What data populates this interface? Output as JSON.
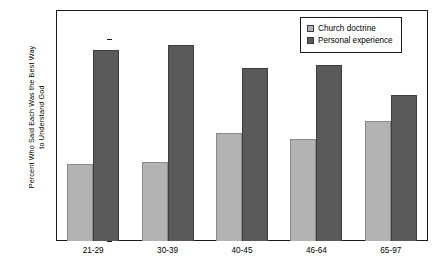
{
  "chart_data": {
    "type": "bar",
    "title": "",
    "subtitle": "",
    "xlabel": "",
    "ylabel": "Percent Who Said Each Was the Best Way\nto Understand God",
    "categories": [
      "21-29",
      "30-39",
      "40-45",
      "46-64",
      "65-97"
    ],
    "series": [
      {
        "name": "Church doctrine",
        "values": [
          26.5,
          27.5,
          37.5,
          35.5,
          41.5
        ],
        "color": "#b3b3b3"
      },
      {
        "name": "Personal experience",
        "values": [
          66.0,
          68.0,
          59.8,
          61.0,
          50.7
        ],
        "color": "#5a5a5a"
      }
    ],
    "ylim": [
      0,
      80
    ],
    "ytick_step": 10,
    "yticks": [
      0,
      10,
      20,
      30,
      40,
      50,
      60,
      70,
      80
    ],
    "grid": false,
    "legend_position": "top-right",
    "axis_color": "#1a1a1a",
    "background": "#ffffff"
  }
}
